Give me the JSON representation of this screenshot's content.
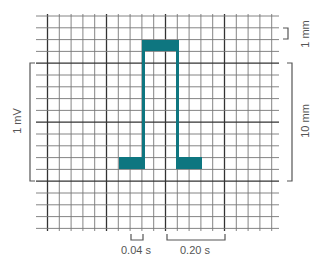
{
  "figure": {
    "type": "ECG calibration pulse on grid paper",
    "grid": {
      "columns": 20,
      "rows": 18,
      "minor_spacing_label": "1 mm",
      "major_every": 5
    },
    "pulse_color": "#0e7680",
    "grid_color": "#555555"
  },
  "labels": {
    "voltage": "1 mV",
    "vertical_mm": "10 mm",
    "one_mm": "1 mm",
    "small_time": "0.04 s",
    "large_time": "0.20 s"
  }
}
